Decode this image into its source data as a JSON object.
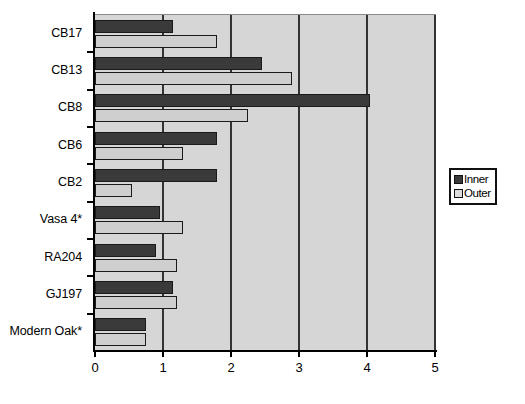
{
  "chart_data": {
    "type": "bar",
    "orientation": "horizontal",
    "title": "",
    "xlabel": "",
    "ylabel": "",
    "xlim": [
      0,
      5
    ],
    "xticks": [
      "0",
      "1",
      "2",
      "3",
      "4",
      "5"
    ],
    "grid": true,
    "grid_axis": "x",
    "legend_position": "right",
    "categories": [
      "CB17",
      "CB13",
      "CB8",
      "CB6",
      "CB2",
      "Vasa 4*",
      "RA204",
      "GJ197",
      "Modern Oak*"
    ],
    "series": [
      {
        "name": "Inner",
        "color": "#3a3a3a",
        "values": [
          1.15,
          2.45,
          4.05,
          1.8,
          1.8,
          0.95,
          0.9,
          1.15,
          0.75
        ]
      },
      {
        "name": "Outer",
        "color": "#cfcfcf",
        "values": [
          1.8,
          2.9,
          2.25,
          1.3,
          0.55,
          1.3,
          1.2,
          1.2,
          0.75
        ]
      }
    ]
  },
  "legend": {
    "entries": [
      {
        "label": "Inner",
        "swatch": "dark-swatch"
      },
      {
        "label": "Outer",
        "swatch": "light-swatch"
      }
    ]
  },
  "colors": {
    "plot_background": "#d6d6d6",
    "inner_bar": "#3a3a3a",
    "outer_bar": "#cfcfcf",
    "gridline": "#333333",
    "axis": "#000000",
    "page_background": "#ffffff"
  }
}
